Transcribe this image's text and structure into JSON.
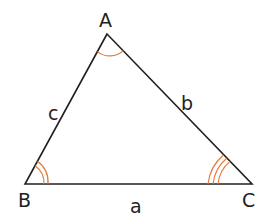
{
  "diagram": {
    "type": "triangle",
    "vertices": [
      {
        "label": "A",
        "x": 107,
        "y": 34
      },
      {
        "label": "B",
        "x": 25,
        "y": 184
      },
      {
        "label": "C",
        "x": 252,
        "y": 184
      }
    ],
    "sides": [
      {
        "label": "a",
        "between": "B-C"
      },
      {
        "label": "b",
        "between": "A-C"
      },
      {
        "label": "c",
        "between": "A-B"
      }
    ],
    "angle_marks": [
      {
        "vertex": "A",
        "arcs": 1
      },
      {
        "vertex": "B",
        "arcs": 2
      },
      {
        "vertex": "C",
        "arcs": 3
      }
    ],
    "colors": {
      "line": "#231f20",
      "arc": "#e07a3c"
    }
  }
}
